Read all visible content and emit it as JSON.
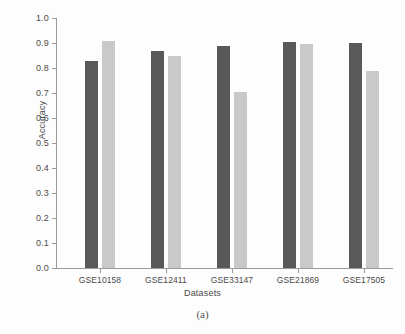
{
  "chart_data": {
    "type": "bar",
    "title": "",
    "xlabel": "Datasets",
    "ylabel": "Accuracy",
    "categories": [
      "GSE10158",
      "GSE12411",
      "GSE33147",
      "GSE21869",
      "GSE17505"
    ],
    "series": [
      {
        "name": "series-dark",
        "color": "#595959",
        "values": [
          0.83,
          0.87,
          0.89,
          0.905,
          0.9
        ]
      },
      {
        "name": "series-light",
        "color": "#c9c9c9",
        "values": [
          0.91,
          0.85,
          0.705,
          0.895,
          0.79
        ]
      }
    ],
    "ylim": [
      0.0,
      1.0
    ],
    "ytick_labels": [
      "0.0",
      "0.1",
      "0.2",
      "0.3",
      "0.4",
      "0.5",
      "0.6",
      "0.7",
      "0.8",
      "0.9",
      "1.0"
    ],
    "ytick_values": [
      0.0,
      0.1,
      0.2,
      0.3,
      0.4,
      0.5,
      0.6,
      0.7,
      0.8,
      0.9,
      1.0
    ],
    "grid": false,
    "legend": "none",
    "caption": "(a)"
  },
  "colors": {
    "background": "#fdfdfd",
    "axis": "#9a9a9a",
    "text": "#4a4a4a",
    "bar_dark": "#595959",
    "bar_light": "#c9c9c9"
  }
}
